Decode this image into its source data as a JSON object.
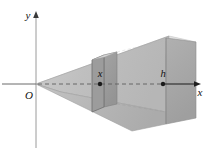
{
  "figure": {
    "background_color": "#ffffff",
    "axes": {
      "x_axis": {
        "label": "x",
        "label_color": "#111111",
        "line_color": "#4a4a4a",
        "arrow": "right-arrowhead"
      },
      "y_axis": {
        "label": "y",
        "label_color": "#111111",
        "line_color": "#8c8c8c",
        "arrow": "up-arrowhead"
      },
      "origin": {
        "label": "O",
        "label_color": "#111111"
      }
    },
    "annotations": [
      {
        "name": "cross-section-distance",
        "label": "x",
        "marker": "filled-dot",
        "marker_color": "#1a1a1a"
      },
      {
        "name": "total-length",
        "label": "h",
        "marker": "filled-dot",
        "marker_color": "#1a1a1a"
      }
    ],
    "solid": {
      "name": "wedge",
      "faces": {
        "top_face_color": "#e3e3e3",
        "top_face_highlight_color": "#efefef",
        "front_face_color": "#bdbdbd",
        "front_lower_face_color": "#b3b3b3",
        "right_end_face_color": "#a8a8a8",
        "cross_section_face_color": "#9a9a9a",
        "cross_section_side_color": "#8e8e8e",
        "shadow_face_color": "#c9c9c9"
      },
      "edge_color": "#7a7a7a",
      "center_line_style": "dashed",
      "center_line_color": "#6e6e6e"
    }
  }
}
